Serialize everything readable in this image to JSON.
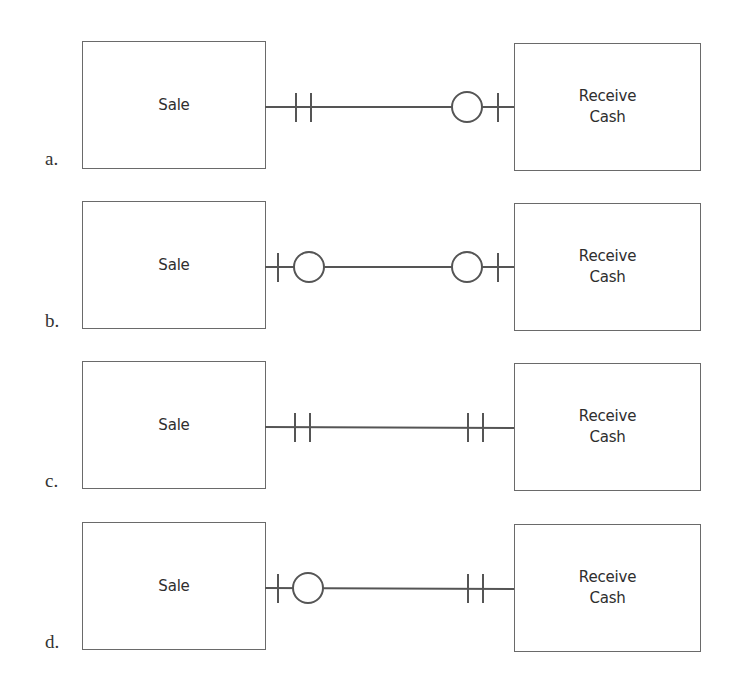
{
  "diagram": {
    "type": "entity-relationship cardinality options",
    "options": [
      {
        "letter": "a.",
        "left_entity": "Sale",
        "right_entity": "Receive\nCash",
        "left_end": "one-and-only-one",
        "right_end": "zero-or-one"
      },
      {
        "letter": "b.",
        "left_entity": "Sale",
        "right_entity": "Receive\nCash",
        "left_end": "zero-or-one",
        "right_end": "zero-or-one"
      },
      {
        "letter": "c.",
        "left_entity": "Sale",
        "right_entity": "Receive\nCash",
        "left_end": "one-and-only-one",
        "right_end": "one-and-only-one"
      },
      {
        "letter": "d.",
        "left_entity": "Sale",
        "right_entity": "Receive\nCash",
        "left_end": "zero-or-one",
        "right_end": "one-and-only-one"
      }
    ],
    "colors": {
      "line": "#555555",
      "box_border": "#6a6a6a",
      "text": "#2e2e2e",
      "background": "#ffffff"
    }
  }
}
